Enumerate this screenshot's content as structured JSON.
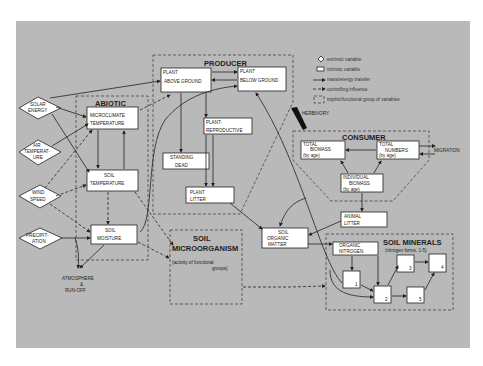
{
  "legend": {
    "extrinsic": "extrinsic variable",
    "intrinsic": "intrinsic variable",
    "mass_energy": "mass/energy transfer",
    "controlling": "controlling influence",
    "group": "trophic/functional group of variables"
  },
  "groups": {
    "producer": "PRODUCER",
    "abiotic": "ABIOTIC",
    "consumer": "CONSUMER",
    "soil_micro_1": "SOIL",
    "soil_micro_2": "MICROORGANISM",
    "soil_micro_sub1": "(activity of functional",
    "soil_micro_sub2": "groups)",
    "soil_minerals": "SOIL MINERALS",
    "soil_minerals_sub": "(nitrogen forms, 1-5)"
  },
  "extrinsic": {
    "solar_1": "SOLAR",
    "solar_2": "ENERGY",
    "air_1": "AIR",
    "air_2": "TEMPERAT-",
    "air_3": "URE",
    "wind_1": "WIND",
    "wind_2": "SPEED",
    "precip_1": "PRECIPIT-",
    "precip_2": "ATION"
  },
  "boxes": {
    "plant_above_1": "PLANT",
    "plant_above_2": "ABOVE GROUND",
    "plant_below_1": "PLANT",
    "plant_below_2": "BELOW GROUND",
    "plant_repro_1": "PLANT-",
    "plant_repro_2": "REPRODUCTIVE",
    "standing_dead_1": "STANDING",
    "standing_dead_2": "DEAD",
    "plant_litter_1": "PLANT",
    "plant_litter_2": "LITTER",
    "micro_temp_1": "MICROCLIMATE",
    "micro_temp_2": "TEMPERATURE",
    "soil_temp_1": "SOIL",
    "soil_temp_2": "TEMPERATURE",
    "soil_moist_1": "SOIL",
    "soil_moist_2": "MOISTURE",
    "som_1": "SOIL",
    "som_2": "ORGANIC",
    "som_3": "MATTER",
    "total_biomass_1": "TOTAL",
    "total_biomass_2": "BIOMASS",
    "total_biomass_3": "(by age)",
    "total_numbers_1": "TOTAL",
    "total_numbers_2": "NUMBERS",
    "total_numbers_3": "(by age)",
    "indiv_biomass_1": "INDIVIDUAL",
    "indiv_biomass_2": "BIOMASS",
    "indiv_biomass_3": "(by age)",
    "animal_litter_1": "ANIMAL",
    "animal_litter_2": "LITTER",
    "organic_n_1": "ORGANIC",
    "organic_n_2": "NITROGEN",
    "n1": "1",
    "n2": "2",
    "n3": "3",
    "n4": "4",
    "n5": "5"
  },
  "labels": {
    "herbivory": "HERBIVORY",
    "migration": "MIGRATION",
    "atmos_1": "ATMOSPHERE",
    "atmos_2": "&",
    "atmos_3": "RUN-OFF"
  }
}
